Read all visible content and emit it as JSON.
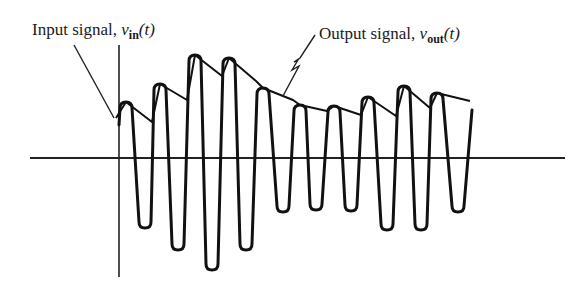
{
  "diagram": {
    "type": "signal-waveform",
    "labels": {
      "input": {
        "text": "Input signal, ",
        "var": "v",
        "sub": "in",
        "arg": "(t)"
      },
      "output": {
        "text": "Output signal, ",
        "var": "v",
        "sub": "out",
        "arg": "(t)"
      }
    },
    "colors": {
      "ink": "#111111",
      "background": "#ffffff"
    },
    "axes": {
      "horizontal": {
        "x1": 30,
        "x2": 565,
        "y": 158
      },
      "vertical": {
        "x": 119,
        "y1": 45,
        "y2": 277
      }
    },
    "waveform_extrema": {
      "peaks": [
        [
          126,
          102
        ],
        [
          160,
          84
        ],
        [
          195,
          55
        ],
        [
          229,
          58
        ],
        [
          263,
          88
        ],
        [
          300,
          105
        ],
        [
          334,
          106
        ],
        [
          368,
          97
        ],
        [
          404,
          86
        ],
        [
          437,
          93
        ]
      ],
      "troughs": [
        [
          145,
          228
        ],
        [
          178,
          250
        ],
        [
          212,
          270
        ],
        [
          246,
          250
        ],
        [
          283,
          212
        ],
        [
          316,
          210
        ],
        [
          351,
          211
        ],
        [
          387,
          230
        ],
        [
          421,
          230
        ],
        [
          458,
          212
        ]
      ],
      "start": [
        119,
        125
      ],
      "end": [
        472,
        110
      ]
    },
    "envelope_points": [
      [
        116,
        118
      ],
      [
        126,
        102
      ],
      [
        152,
        122
      ],
      [
        160,
        84
      ],
      [
        187,
        100
      ],
      [
        195,
        55
      ],
      [
        222,
        76
      ],
      [
        229,
        58
      ],
      [
        256,
        81
      ],
      [
        263,
        88
      ],
      [
        293,
        100
      ],
      [
        300,
        105
      ],
      [
        327,
        111
      ],
      [
        334,
        106
      ],
      [
        361,
        115
      ],
      [
        368,
        97
      ],
      [
        396,
        116
      ],
      [
        404,
        86
      ],
      [
        430,
        108
      ],
      [
        437,
        93
      ],
      [
        470,
        101
      ]
    ]
  }
}
